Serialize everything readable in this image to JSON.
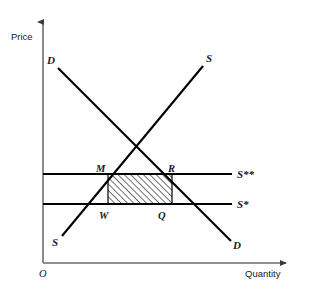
{
  "figure": {
    "type": "economics-supply-demand-diagram",
    "background_color": "#ffffff",
    "ink_color": "#000000",
    "width": 323,
    "height": 289
  },
  "axes": {
    "y_label": "Price",
    "x_label": "Quantity",
    "origin_label": "O",
    "y_axis": {
      "x": 43,
      "y_top": 18,
      "y_bottom": 263
    },
    "x_axis": {
      "y": 263,
      "x_left": 43,
      "x_right": 291
    }
  },
  "curves": [
    {
      "name": "demand",
      "label_top": "D",
      "label_bottom": "D",
      "from": {
        "x": 58,
        "y": 68
      },
      "to": {
        "x": 231,
        "y": 241
      },
      "label_top_pos": {
        "x": 47,
        "y": 64
      },
      "label_bottom_pos": {
        "x": 233,
        "y": 249
      }
    },
    {
      "name": "supply",
      "label_top": "S",
      "label_bottom": "S",
      "from": {
        "x": 62,
        "y": 236
      },
      "to": {
        "x": 203,
        "y": 66
      },
      "label_top_pos": {
        "x": 206,
        "y": 62
      },
      "label_bottom_pos": {
        "x": 52,
        "y": 246
      }
    }
  ],
  "price_lines": [
    {
      "name": "upper-price-line",
      "label": "S**",
      "y": 174,
      "x_start": 43,
      "x_end": 232,
      "label_pos": {
        "x": 237,
        "y": 178
      }
    },
    {
      "name": "lower-price-line",
      "label": "S*",
      "y": 204,
      "x_start": 43,
      "x_end": 232,
      "label_pos": {
        "x": 237,
        "y": 208
      }
    }
  ],
  "points": [
    {
      "label": "M",
      "x": 108,
      "y": 174,
      "label_pos": {
        "x": 97,
        "y": 171
      }
    },
    {
      "label": "R",
      "x": 172,
      "y": 174,
      "label_pos": {
        "x": 169,
        "y": 171
      }
    },
    {
      "label": "W",
      "x": 108,
      "y": 204,
      "label_pos": {
        "x": 99,
        "y": 218
      }
    },
    {
      "label": "Q",
      "x": 172,
      "y": 204,
      "label_pos": {
        "x": 158,
        "y": 218
      }
    }
  ],
  "shaded_region": {
    "name": "deadweight-rectangle-MRQW",
    "vertices": "M-R-Q-W",
    "x": 108,
    "y": 174,
    "width": 64,
    "height": 30,
    "fill_pattern": "diagonal-hatch",
    "hatch_angle_deg": 45,
    "hatch_spacing_px": 4.5
  },
  "equilibrium": {
    "x": 134,
    "y": 148
  }
}
